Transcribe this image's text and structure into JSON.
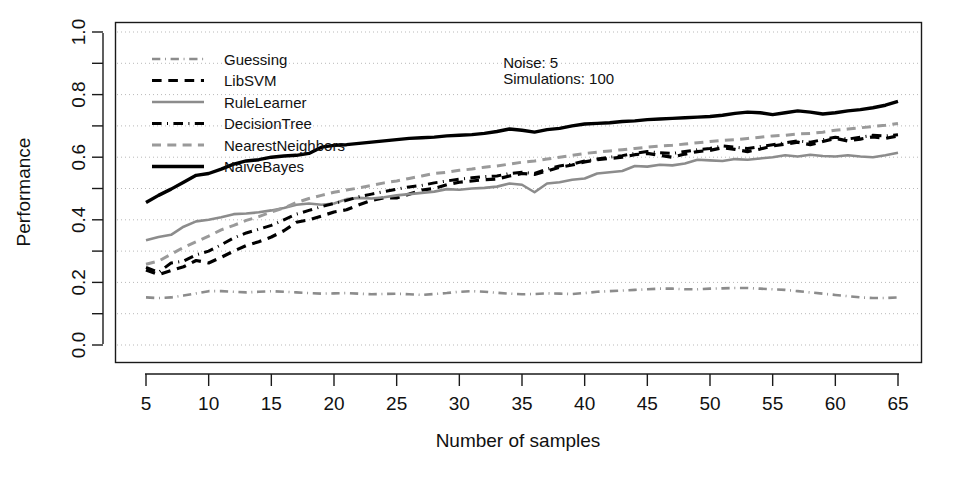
{
  "chart_data": {
    "type": "line",
    "title": "",
    "xlabel": "Number of samples",
    "ylabel": "Performance",
    "xlim": [
      5,
      65
    ],
    "ylim": [
      0.0,
      1.0
    ],
    "xticks": [
      5,
      10,
      15,
      20,
      25,
      30,
      35,
      40,
      45,
      50,
      55,
      60,
      65
    ],
    "xtick_labels": [
      "5",
      "10",
      "15",
      "20",
      "25",
      "30",
      "35",
      "40",
      "45",
      "50",
      "55",
      "60",
      "65"
    ],
    "yticks": [
      0.0,
      0.2,
      0.4,
      0.6,
      0.8,
      1.0
    ],
    "ytick_labels": [
      "0.0",
      "0.2",
      "0.4",
      "0.6",
      "0.8",
      "1.0"
    ],
    "y_minor_ticks": [
      0.1,
      0.3,
      0.5,
      0.7,
      0.9
    ],
    "grid": true,
    "grid_style": "dotted",
    "legend_position": "top-left",
    "x": [
      5,
      6,
      7,
      8,
      9,
      10,
      11,
      12,
      13,
      14,
      15,
      16,
      17,
      18,
      19,
      20,
      21,
      22,
      23,
      24,
      25,
      26,
      27,
      28,
      29,
      30,
      31,
      32,
      33,
      34,
      35,
      36,
      37,
      38,
      39,
      40,
      41,
      42,
      43,
      44,
      45,
      46,
      47,
      48,
      49,
      50,
      51,
      52,
      53,
      54,
      55,
      56,
      57,
      58,
      59,
      60,
      61,
      62,
      63,
      64,
      65
    ],
    "series": [
      {
        "name": "Guessing",
        "color": "#8c8c8c",
        "dash": "dashdot",
        "width": 2.6,
        "values": [
          0.152,
          0.15,
          0.152,
          0.158,
          0.165,
          0.172,
          0.172,
          0.17,
          0.168,
          0.17,
          0.172,
          0.17,
          0.168,
          0.166,
          0.164,
          0.165,
          0.166,
          0.164,
          0.162,
          0.163,
          0.164,
          0.162,
          0.16,
          0.163,
          0.166,
          0.17,
          0.172,
          0.17,
          0.167,
          0.164,
          0.162,
          0.163,
          0.165,
          0.164,
          0.163,
          0.166,
          0.17,
          0.172,
          0.174,
          0.176,
          0.178,
          0.18,
          0.18,
          0.178,
          0.178,
          0.18,
          0.181,
          0.182,
          0.182,
          0.18,
          0.178,
          0.176,
          0.172,
          0.168,
          0.164,
          0.16,
          0.156,
          0.152,
          0.15,
          0.15,
          0.152
        ]
      },
      {
        "name": "LibSVM",
        "color": "#000000",
        "dash": "dashed",
        "width": 3.2,
        "values": [
          0.24,
          0.225,
          0.238,
          0.25,
          0.27,
          0.262,
          0.28,
          0.3,
          0.318,
          0.33,
          0.345,
          0.365,
          0.392,
          0.4,
          0.412,
          0.425,
          0.432,
          0.448,
          0.462,
          0.47,
          0.47,
          0.482,
          0.495,
          0.5,
          0.512,
          0.52,
          0.524,
          0.528,
          0.53,
          0.54,
          0.548,
          0.545,
          0.556,
          0.568,
          0.575,
          0.585,
          0.592,
          0.596,
          0.6,
          0.608,
          0.612,
          0.606,
          0.6,
          0.61,
          0.618,
          0.622,
          0.63,
          0.625,
          0.618,
          0.626,
          0.636,
          0.642,
          0.648,
          0.64,
          0.65,
          0.66,
          0.652,
          0.658,
          0.665,
          0.66,
          0.668
        ]
      },
      {
        "name": "RuleLearner",
        "color": "#8c8c8c",
        "dash": "solid",
        "width": 2.6,
        "values": [
          0.335,
          0.345,
          0.352,
          0.378,
          0.395,
          0.4,
          0.408,
          0.418,
          0.42,
          0.424,
          0.43,
          0.438,
          0.448,
          0.452,
          0.448,
          0.452,
          0.466,
          0.47,
          0.468,
          0.472,
          0.478,
          0.482,
          0.486,
          0.49,
          0.498,
          0.496,
          0.5,
          0.502,
          0.506,
          0.516,
          0.512,
          0.488,
          0.516,
          0.52,
          0.528,
          0.532,
          0.548,
          0.552,
          0.556,
          0.572,
          0.57,
          0.576,
          0.574,
          0.58,
          0.592,
          0.59,
          0.588,
          0.594,
          0.592,
          0.596,
          0.6,
          0.606,
          0.602,
          0.608,
          0.604,
          0.602,
          0.606,
          0.602,
          0.6,
          0.606,
          0.614
        ]
      },
      {
        "name": "DecisionTree",
        "color": "#000000",
        "dash": "dashdot",
        "width": 3.0,
        "values": [
          0.248,
          0.232,
          0.262,
          0.268,
          0.288,
          0.3,
          0.32,
          0.342,
          0.358,
          0.37,
          0.382,
          0.4,
          0.418,
          0.43,
          0.442,
          0.452,
          0.462,
          0.474,
          0.482,
          0.49,
          0.498,
          0.505,
          0.51,
          0.518,
          0.524,
          0.53,
          0.534,
          0.538,
          0.54,
          0.548,
          0.552,
          0.548,
          0.562,
          0.572,
          0.578,
          0.588,
          0.594,
          0.6,
          0.605,
          0.612,
          0.618,
          0.614,
          0.612,
          0.618,
          0.624,
          0.628,
          0.636,
          0.632,
          0.628,
          0.634,
          0.64,
          0.646,
          0.652,
          0.648,
          0.656,
          0.664,
          0.658,
          0.664,
          0.67,
          0.668,
          0.672
        ]
      },
      {
        "name": "NearestNeighbors",
        "color": "#9a9a9a",
        "dash": "dashed",
        "width": 3.0,
        "values": [
          0.258,
          0.268,
          0.29,
          0.312,
          0.33,
          0.348,
          0.368,
          0.382,
          0.398,
          0.41,
          0.425,
          0.438,
          0.455,
          0.468,
          0.478,
          0.488,
          0.495,
          0.502,
          0.51,
          0.518,
          0.524,
          0.532,
          0.54,
          0.548,
          0.552,
          0.558,
          0.562,
          0.568,
          0.572,
          0.578,
          0.584,
          0.588,
          0.594,
          0.6,
          0.606,
          0.612,
          0.616,
          0.62,
          0.624,
          0.628,
          0.632,
          0.636,
          0.638,
          0.642,
          0.646,
          0.65,
          0.654,
          0.656,
          0.66,
          0.664,
          0.668,
          0.67,
          0.674,
          0.676,
          0.68,
          0.686,
          0.69,
          0.694,
          0.698,
          0.702,
          0.708
        ]
      },
      {
        "name": "NaiveBayes",
        "color": "#000000",
        "dash": "solid",
        "width": 3.4,
        "values": [
          0.455,
          0.478,
          0.498,
          0.52,
          0.542,
          0.548,
          0.562,
          0.578,
          0.588,
          0.592,
          0.6,
          0.604,
          0.606,
          0.612,
          0.632,
          0.638,
          0.64,
          0.644,
          0.648,
          0.652,
          0.656,
          0.66,
          0.662,
          0.664,
          0.668,
          0.67,
          0.672,
          0.676,
          0.682,
          0.69,
          0.686,
          0.68,
          0.688,
          0.692,
          0.7,
          0.706,
          0.708,
          0.71,
          0.714,
          0.716,
          0.72,
          0.722,
          0.724,
          0.726,
          0.728,
          0.73,
          0.734,
          0.74,
          0.744,
          0.742,
          0.736,
          0.742,
          0.748,
          0.744,
          0.738,
          0.742,
          0.748,
          0.752,
          0.758,
          0.766,
          0.778
        ]
      }
    ],
    "annotations": [
      {
        "text": "Noise: 5",
        "x": 33.5,
        "y": 0.885
      },
      {
        "text": "Simulations: 100",
        "x": 33.5,
        "y": 0.835
      }
    ]
  }
}
